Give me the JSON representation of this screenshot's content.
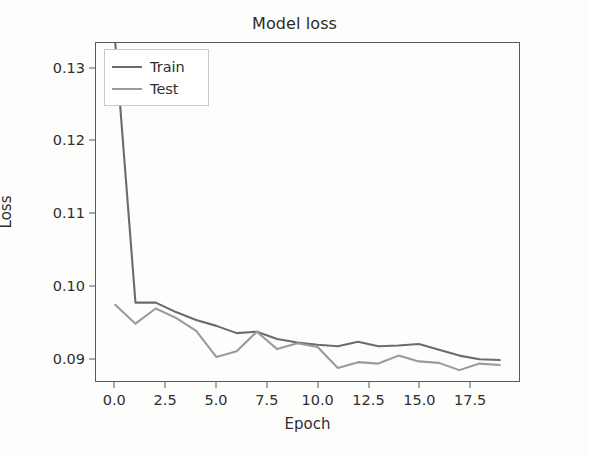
{
  "chart_data": {
    "type": "line",
    "title": "Model loss",
    "xlabel": "Epoch",
    "ylabel": "Loss",
    "grid": false,
    "legend_position": "upper left",
    "x": [
      0,
      1,
      2,
      3,
      4,
      5,
      6,
      7,
      8,
      9,
      10,
      11,
      12,
      13,
      14,
      15,
      16,
      17,
      18,
      19
    ],
    "xlim": [
      -0.95,
      19.95
    ],
    "ylim": [
      0.0869,
      0.1335
    ],
    "xticks": [
      0.0,
      2.5,
      5.0,
      7.5,
      10.0,
      12.5,
      15.0,
      17.5
    ],
    "xtick_labels": [
      "0.0",
      "2.5",
      "5.0",
      "7.5",
      "10.0",
      "12.5",
      "15.0",
      "17.5"
    ],
    "yticks": [
      0.09,
      0.1,
      0.11,
      0.12,
      0.13
    ],
    "ytick_labels": [
      "0.09",
      "0.10",
      "0.11",
      "0.12",
      "0.13"
    ],
    "series": [
      {
        "name": "Train",
        "color": "#6b6b6b",
        "values": [
          0.1336,
          0.0977,
          0.0977,
          0.0964,
          0.0953,
          0.0945,
          0.0935,
          0.0937,
          0.0927,
          0.0922,
          0.0919,
          0.0917,
          0.0923,
          0.0917,
          0.0918,
          0.092,
          0.0912,
          0.0904,
          0.0899,
          0.0898
        ]
      },
      {
        "name": "Test",
        "color": "#9a9a9a",
        "values": [
          0.0974,
          0.0948,
          0.0969,
          0.0956,
          0.0938,
          0.0902,
          0.091,
          0.0937,
          0.0913,
          0.0921,
          0.0916,
          0.0887,
          0.0895,
          0.0893,
          0.0904,
          0.0896,
          0.0894,
          0.0884,
          0.0893,
          0.0891
        ]
      }
    ]
  },
  "legend": {
    "entries": [
      {
        "label": "Train"
      },
      {
        "label": "Test"
      }
    ]
  }
}
